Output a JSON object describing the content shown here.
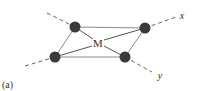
{
  "diagram": {
    "panel_label": "(a)",
    "center_label": "M",
    "axis_x_label": "x",
    "axis_y_label": "y",
    "colors": {
      "atom": "#3a3a3a",
      "bond": "#8a8a8a",
      "axis": "#555555",
      "text": "#333333"
    }
  }
}
